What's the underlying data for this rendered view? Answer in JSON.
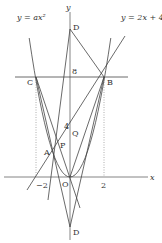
{
  "diagram": {
    "title": "",
    "axes": {
      "x_label": "x",
      "y_label": "y",
      "origin_label": "O"
    },
    "curves": {
      "parabola_label": "y = ax²",
      "line_label": "y = 2x + 4"
    },
    "points": {
      "A": "A",
      "B": "B",
      "C": "C",
      "D_top": "D",
      "D_bottom": "D",
      "P": "P",
      "Q": "Q",
      "O": "O"
    },
    "ticks": {
      "x_neg2": "−2",
      "x_pos2": "2",
      "y_4": "4",
      "y_8": "8"
    },
    "colors": {
      "stroke": "#444444",
      "dotted": "#888888",
      "background": "#ffffff"
    }
  }
}
